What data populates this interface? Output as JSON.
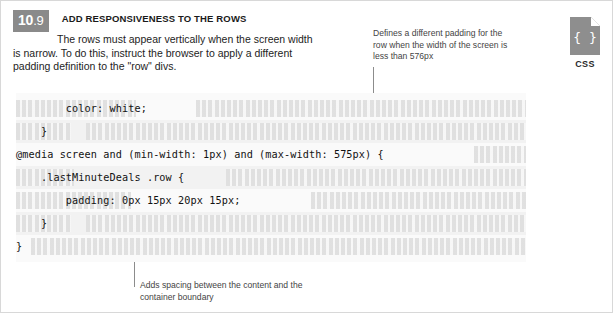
{
  "page": {
    "number_major": "10",
    "number_minor": ".9",
    "title": "ADD RESPONSIVENESS TO THE ROWS",
    "intro": "The rows must appear vertically when the screen width is narrow. To do this, instruct the browser to apply a different padding definition to the \"row\" divs."
  },
  "badge": {
    "icon": "css-file-icon",
    "glyph": "{ }",
    "label": "CSS"
  },
  "callouts": [
    {
      "id": "top",
      "text": "Defines a different padding for the row when the width of the screen is less than 576px"
    },
    {
      "id": "bottom",
      "text": "Adds spacing between the content and the container boundary"
    }
  ],
  "code": {
    "language": "CSS",
    "lines": [
      {
        "lead_fill": 120,
        "indent": "        ",
        "text": "color: white;",
        "trail_fill": 330,
        "band": false
      },
      {
        "lead_fill": 55,
        "indent": "    ",
        "text": "}",
        "trail_fill": 440,
        "band": true
      },
      {
        "lead_fill": 0,
        "indent": "",
        "text": "@media screen and (min-width: 1px) and (max-width: 575px) {",
        "trail_fill": 52,
        "band": false
      },
      {
        "lead_fill": 58,
        "indent": "    ",
        "text": ".lastMinuteDeals .row {",
        "trail_fill": 300,
        "band": true
      },
      {
        "lead_fill": 115,
        "indent": "        ",
        "text": "padding: 0px 15px 20px 15px;",
        "trail_fill": 215,
        "band": false
      },
      {
        "lead_fill": 55,
        "indent": "    ",
        "text": "}",
        "trail_fill": 440,
        "band": true
      },
      {
        "lead_fill": 0,
        "indent": "",
        "text": "}",
        "trail_fill": 495,
        "band": false
      }
    ]
  },
  "colors": {
    "badge_gray": "#8a8a8a",
    "code_bg": "#fafafa",
    "band_bg": "#f2f2f2",
    "fill_bar": "#dfdfdf",
    "leader_line": "#8c8c8c",
    "frame_border": "#d8d8d8"
  }
}
